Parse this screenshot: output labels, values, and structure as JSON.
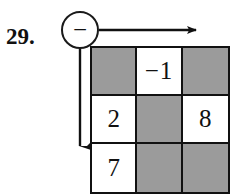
{
  "problem": {
    "number_label": "29."
  },
  "operator": {
    "symbol": "−",
    "name": "minus"
  },
  "arrows": {
    "right_arrow_name": "row-direction-arrow",
    "down_arrow_name": "column-direction-arrow"
  },
  "grid": {
    "rows": 3,
    "columns": 3,
    "shaded_color": "#9b9b9b",
    "blank_color": "#ffffff",
    "border_color": "#111111",
    "cells": [
      [
        {
          "value": "",
          "state": "shaded"
        },
        {
          "value": "−1",
          "state": "blank"
        },
        {
          "value": "",
          "state": "shaded"
        }
      ],
      [
        {
          "value": "2",
          "state": "blank"
        },
        {
          "value": "",
          "state": "shaded"
        },
        {
          "value": "8",
          "state": "blank"
        }
      ],
      [
        {
          "value": "7",
          "state": "blank"
        },
        {
          "value": "",
          "state": "shaded"
        },
        {
          "value": "",
          "state": "shaded"
        }
      ]
    ]
  }
}
